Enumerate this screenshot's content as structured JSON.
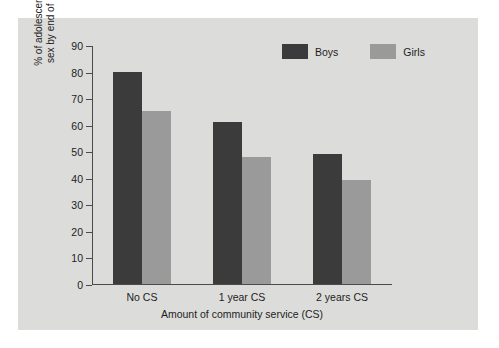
{
  "chart_data": {
    "type": "bar",
    "title": "",
    "xlabel": "Amount of community service (CS)",
    "ylabel_line1": "% of adolescents initiating",
    "ylabel_line2": "sex by end of 10th grade",
    "categories": [
      "No CS",
      "1 year CS",
      "2 years CS"
    ],
    "series": [
      {
        "name": "Boys",
        "color": "#3b3b3b",
        "values": [
          80,
          61,
          49
        ]
      },
      {
        "name": "Girls",
        "color": "#9a9a9a",
        "values": [
          65,
          48,
          39
        ]
      }
    ],
    "ylim": [
      0,
      90
    ],
    "yticks": [
      0,
      10,
      20,
      30,
      40,
      50,
      60,
      70,
      80,
      90
    ],
    "ytick_labels": [
      "0",
      "10",
      "20",
      "30",
      "40",
      "50",
      "60",
      "70",
      "80",
      "90"
    ],
    "grid": false,
    "legend_position": "top-right",
    "panel_color": "#dcdcda",
    "axis_color": "#4a4a4a",
    "page_background": "#ffffff"
  }
}
